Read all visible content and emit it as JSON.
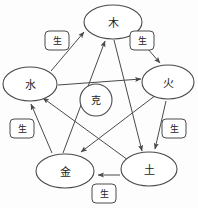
{
  "diagram": {
    "stroke_color": "#4a4a4a",
    "background_color": "#fdfdfd",
    "text_color": "#1c1c1c",
    "center": {
      "label": "克",
      "name": "overcoming-cycle-center"
    },
    "nodes": [
      {
        "id": "wood",
        "label": "木",
        "cx": 113,
        "cy": 22,
        "rx": 29,
        "ry": 17
      },
      {
        "id": "fire",
        "label": "火",
        "cx": 168,
        "cy": 82,
        "rx": 26,
        "ry": 17
      },
      {
        "id": "earth",
        "label": "土",
        "cx": 149,
        "cy": 169,
        "rx": 28,
        "ry": 17
      },
      {
        "id": "metal",
        "label": "金",
        "cx": 65,
        "cy": 171,
        "rx": 29,
        "ry": 17
      },
      {
        "id": "water",
        "label": "水",
        "cx": 30,
        "cy": 84,
        "rx": 27,
        "ry": 17
      }
    ],
    "generating_tags": [
      {
        "id": "tag-water-wood",
        "label": "生",
        "x": 57,
        "y": 41
      },
      {
        "id": "tag-wood-fire",
        "label": "生",
        "x": 142,
        "y": 41
      },
      {
        "id": "tag-fire-earth",
        "label": "生",
        "x": 174,
        "y": 129
      },
      {
        "id": "tag-earth-metal",
        "label": "生",
        "x": 104,
        "y": 194
      },
      {
        "id": "tag-metal-water",
        "label": "生",
        "x": 22,
        "y": 129
      }
    ],
    "generating_edges": [
      {
        "id": "water-to-wood",
        "from": "water",
        "to": "wood"
      },
      {
        "id": "wood-to-fire",
        "from": "wood",
        "to": "fire"
      },
      {
        "id": "fire-to-earth",
        "from": "fire",
        "to": "earth"
      },
      {
        "id": "earth-to-metal",
        "from": "earth",
        "to": "metal"
      },
      {
        "id": "metal-to-water",
        "from": "metal",
        "to": "water"
      }
    ],
    "overcoming_edges": [
      {
        "id": "water-to-fire",
        "from": "water",
        "to": "fire"
      },
      {
        "id": "fire-to-metal",
        "from": "fire",
        "to": "metal"
      },
      {
        "id": "metal-to-wood",
        "from": "metal",
        "to": "wood"
      },
      {
        "id": "wood-to-earth",
        "from": "wood",
        "to": "earth"
      },
      {
        "id": "earth-to-water",
        "from": "earth",
        "to": "water"
      }
    ]
  }
}
